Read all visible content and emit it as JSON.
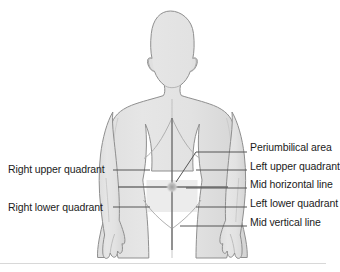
{
  "diagram": {
    "colors": {
      "background": "#ffffff",
      "body_fill": "#e3e3e3",
      "body_fill_shadow": "#d6d6d6",
      "body_outline": "#8f8f8f",
      "quadrant_line": "#6e6e6e",
      "leader_line": "#5a5a5a",
      "text": "#1b1b1b",
      "bottom_rule": "#d8d8d8"
    },
    "labels_left": [
      {
        "id": "right-upper-quadrant",
        "text": "Right upper quadrant"
      },
      {
        "id": "right-lower-quadrant",
        "text": "Right lower quadrant"
      }
    ],
    "labels_right": [
      {
        "id": "periumbilical-area",
        "text": "Periumbilical area"
      },
      {
        "id": "left-upper-quadrant",
        "text": "Left upper quadrant"
      },
      {
        "id": "mid-horizontal-line",
        "text": "Mid horizontal line"
      },
      {
        "id": "left-lower-quadrant",
        "text": "Left lower quadrant"
      },
      {
        "id": "mid-vertical-line",
        "text": "Mid vertical line"
      }
    ],
    "landmarks": {
      "umbilicus_center_x": 172,
      "umbilicus_center_y": 187,
      "mid_vertical_line_top_y": 118,
      "mid_vertical_line_bottom_y": 250,
      "mid_horizontal_line_y": 187
    }
  }
}
